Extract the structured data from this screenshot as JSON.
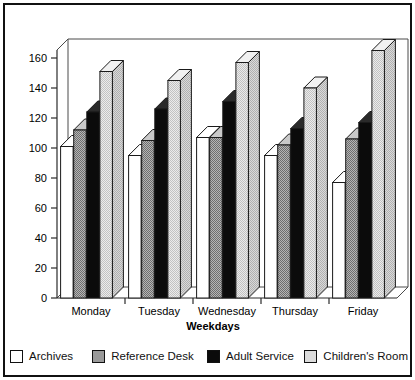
{
  "chart_data": {
    "type": "bar",
    "title": "",
    "subtitle": "",
    "xlabel": "Weekdays",
    "ylabel": "",
    "categories": [
      "Monday",
      "Tuesday",
      "Wednesday",
      "Thursday",
      "Friday"
    ],
    "series": [
      {
        "name": "Archives",
        "color": "#ffffff",
        "values": [
          101,
          95,
          107,
          95,
          77
        ]
      },
      {
        "name": "Reference Desk",
        "color": "#9a9a9a",
        "values": [
          112,
          105,
          107,
          102,
          106
        ]
      },
      {
        "name": "Adult Service",
        "color": "#0b0b0b",
        "values": [
          124,
          126,
          131,
          113,
          117
        ]
      },
      {
        "name": "Children's Room",
        "color": "#dcdcdc",
        "values": [
          151,
          145,
          157,
          140,
          165
        ]
      }
    ],
    "ylim": [
      0,
      170
    ],
    "ytick_labels": [
      "0",
      "20",
      "40",
      "60",
      "80",
      "100",
      "120",
      "140",
      "160"
    ],
    "ytick_values": [
      0,
      20,
      40,
      60,
      80,
      100,
      120,
      140,
      160
    ],
    "grid": false,
    "legend_position": "bottom",
    "style": "3d-grouped-bars"
  },
  "legend": {
    "items": [
      {
        "label": "Archives",
        "swatch": "swatch-archives"
      },
      {
        "label": "Reference Desk",
        "swatch": "swatch-reference-desk"
      },
      {
        "label": "Adult Service",
        "swatch": "swatch-adult-service"
      },
      {
        "label": "Children's Room",
        "swatch": "swatch-childrens-room"
      }
    ]
  },
  "axis": {
    "x_title": "Weekdays"
  }
}
